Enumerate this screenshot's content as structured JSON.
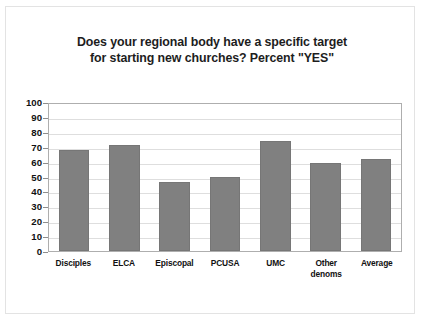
{
  "chart_data": {
    "type": "bar",
    "title": "Does your regional body have a specific target for starting new churches? Percent \"YES\"",
    "title_lines": [
      "Does your regional body have a specific target",
      "for starting new churches? Percent \"YES\""
    ],
    "categories": [
      "Disciples",
      "ELCA",
      "Episcopal",
      "PCUSA",
      "UMC",
      "Other denoms",
      "Average"
    ],
    "category_lines": [
      [
        "Disciples"
      ],
      [
        "ELCA"
      ],
      [
        "Episcopal"
      ],
      [
        "PCUSA"
      ],
      [
        "UMC"
      ],
      [
        "Other",
        "denoms"
      ],
      [
        "Average"
      ]
    ],
    "values": [
      68,
      71,
      46,
      50,
      74,
      59,
      62
    ],
    "xlabel": "",
    "ylabel": "",
    "ylim": [
      0,
      100
    ],
    "ytick_step": 10,
    "yticks": [
      100,
      90,
      80,
      70,
      60,
      50,
      40,
      30,
      20,
      10,
      0
    ],
    "ytick_labels": [
      "100",
      "90",
      "80",
      "70",
      "60",
      "50",
      "40",
      "30",
      "20",
      "10",
      "0"
    ],
    "grid": "horizontal",
    "legend": "none",
    "series": [
      {
        "name": "Percent YES",
        "values": [
          68,
          71,
          46,
          50,
          74,
          59,
          62
        ]
      }
    ],
    "colors": {
      "bar": "#808080",
      "bar_border": "#767676",
      "gridline": "#dedede",
      "plot_border": "#aeaeae",
      "text": "#111111",
      "title": "#1d1d1d",
      "background": "#ffffff"
    }
  }
}
